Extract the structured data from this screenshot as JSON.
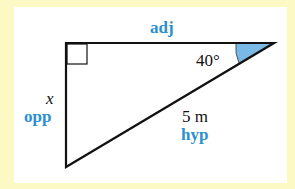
{
  "diagram": {
    "type": "right-triangle",
    "labels": {
      "top_side": "adj",
      "left_side_variable": "x",
      "left_side_role": "opp",
      "hypotenuse_length": "5 m",
      "hypotenuse_role": "hyp",
      "angle": "40°"
    },
    "colors": {
      "background": "#fdf9c4",
      "panel": "#ffffff",
      "label_accent": "#2b8fd0",
      "angle_fill": "#7ab8e6",
      "lines": "#111111"
    }
  }
}
